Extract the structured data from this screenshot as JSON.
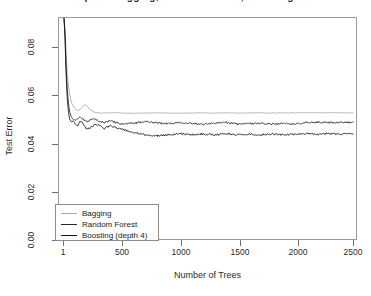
{
  "chart_data": {
    "type": "line",
    "title": "Spam: Bagging, Random Forest, Boosting",
    "xlabel": "Number of Trees",
    "ylabel": "Test Error",
    "xlim": [
      1,
      2500
    ],
    "ylim": [
      0.0,
      0.095
    ],
    "grid": false,
    "legend_position": "bottom-left",
    "xticks": [
      1,
      500,
      1000,
      1500,
      2000,
      2500
    ],
    "xtick_labels": [
      "1",
      "500",
      "1000",
      "1500",
      "2000",
      "2500"
    ],
    "yticks": [
      0.0,
      0.02,
      0.04,
      0.06,
      0.08
    ],
    "ytick_labels": [
      "0.00",
      "0.02",
      "0.04",
      "0.06",
      "0.08"
    ],
    "series": [
      {
        "name": "Bagging",
        "color": "#a8a8a8",
        "x": [
          1,
          10,
          20,
          30,
          40,
          50,
          60,
          70,
          80,
          90,
          100,
          120,
          140,
          160,
          180,
          200,
          225,
          250,
          275,
          300,
          350,
          400,
          450,
          500,
          600,
          700,
          800,
          900,
          1000,
          1100,
          1200,
          1300,
          1400,
          1500,
          1600,
          1700,
          1800,
          1900,
          2000,
          2100,
          2200,
          2300,
          2400,
          2500
        ],
        "y": [
          0.095,
          0.0905,
          0.079,
          0.0705,
          0.066,
          0.0625,
          0.06,
          0.0585,
          0.0575,
          0.0568,
          0.0562,
          0.0556,
          0.056,
          0.0572,
          0.058,
          0.0575,
          0.0562,
          0.0552,
          0.0548,
          0.0546,
          0.0545,
          0.0546,
          0.0547,
          0.0545,
          0.0544,
          0.0545,
          0.0546,
          0.0545,
          0.0544,
          0.0545,
          0.0546,
          0.0545,
          0.0546,
          0.0545,
          0.0546,
          0.0546,
          0.0545,
          0.0546,
          0.0546,
          0.0547,
          0.0546,
          0.0547,
          0.0546,
          0.0546
        ]
      },
      {
        "name": "Random Forest",
        "color": "#262626",
        "x": [
          1,
          10,
          20,
          30,
          40,
          50,
          60,
          70,
          80,
          90,
          100,
          120,
          140,
          160,
          180,
          200,
          225,
          250,
          275,
          300,
          350,
          400,
          450,
          500,
          600,
          700,
          800,
          900,
          1000,
          1100,
          1200,
          1300,
          1400,
          1500,
          1600,
          1700,
          1800,
          1900,
          2000,
          2100,
          2200,
          2300,
          2400,
          2500
        ],
        "y": [
          0.095,
          0.088,
          0.0735,
          0.064,
          0.0585,
          0.0552,
          0.0535,
          0.0525,
          0.0518,
          0.0516,
          0.0514,
          0.052,
          0.0528,
          0.0522,
          0.0512,
          0.0508,
          0.0515,
          0.0522,
          0.0518,
          0.051,
          0.0505,
          0.0512,
          0.0505,
          0.0498,
          0.0502,
          0.0508,
          0.0504,
          0.05,
          0.0505,
          0.0502,
          0.0498,
          0.0502,
          0.0505,
          0.0498,
          0.05,
          0.0502,
          0.0498,
          0.05,
          0.0498,
          0.0504,
          0.0506,
          0.0505,
          0.0506,
          0.0505
        ]
      },
      {
        "name": "Boosting (depth 4)",
        "color": "#111111",
        "x": [
          1,
          10,
          20,
          30,
          40,
          50,
          60,
          70,
          80,
          90,
          100,
          120,
          140,
          160,
          180,
          200,
          225,
          250,
          275,
          300,
          350,
          400,
          450,
          500,
          600,
          700,
          800,
          900,
          1000,
          1100,
          1200,
          1300,
          1400,
          1500,
          1600,
          1700,
          1800,
          1900,
          2000,
          2100,
          2200,
          2300,
          2400,
          2500
        ],
        "y": [
          0.095,
          0.086,
          0.07,
          0.06,
          0.0548,
          0.052,
          0.051,
          0.0508,
          0.0512,
          0.0505,
          0.0498,
          0.049,
          0.0512,
          0.0505,
          0.0488,
          0.0476,
          0.0482,
          0.049,
          0.0498,
          0.0492,
          0.048,
          0.049,
          0.0484,
          0.0476,
          0.0462,
          0.0452,
          0.0448,
          0.0452,
          0.0458,
          0.0452,
          0.0456,
          0.0452,
          0.0458,
          0.0452,
          0.0455,
          0.0452,
          0.0456,
          0.0452,
          0.0455,
          0.0458,
          0.0455,
          0.0458,
          0.0455,
          0.0458
        ]
      }
    ]
  },
  "axes": {
    "y_title": "Test Error",
    "x_title": "Number of Trees",
    "y_tick_labels": [
      "0.08",
      "0.06",
      "0.04",
      "0.02",
      "0.00"
    ],
    "x_tick_labels": [
      "1",
      "500",
      "1000",
      "1500",
      "2000",
      "2500"
    ]
  },
  "legend": {
    "entries": [
      {
        "label": "Bagging",
        "color": "#a8a8a8"
      },
      {
        "label": "Random Forest",
        "color": "#262626"
      },
      {
        "label": "Boosting (depth 4)",
        "color": "#111111"
      }
    ]
  },
  "title": {
    "text": "Spam: Bagging, Random Forest, Boosting"
  }
}
